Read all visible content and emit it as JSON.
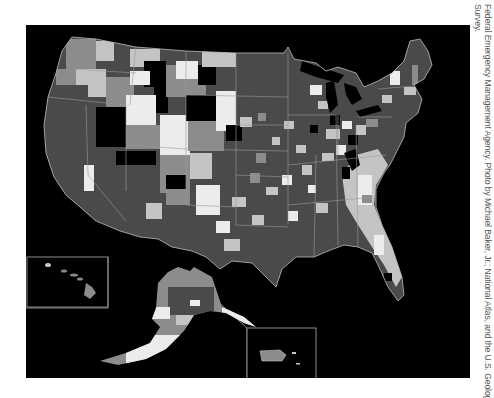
{
  "figure": {
    "type": "choropleth-map",
    "colors": {
      "background": "#000000",
      "darkest": "#000000",
      "dark_gray": "#4a4a4a",
      "mid_gray": "#8c8c8c",
      "light_gray": "#c4c4c4",
      "near_white": "#ececec",
      "border": "#9a9a9a"
    },
    "insets": [
      {
        "name": "Hawaii"
      },
      {
        "name": "Alaska"
      },
      {
        "name": "Puerto Rico"
      }
    ]
  },
  "caption": {
    "line1": "Federal Emergency Management Agency. Photo by Michael Baker, Jr.; National Atlas, and the U.S. Geological",
    "line2": "Survey."
  }
}
